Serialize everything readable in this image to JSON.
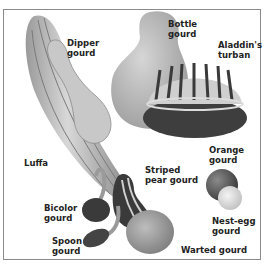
{
  "figure": {
    "labels": {
      "dipper": [
        "Dipper",
        "gourd"
      ],
      "bottle": [
        "Bottle",
        "gourd"
      ],
      "aladdin": [
        "Aladdin's",
        "turban"
      ],
      "luffa": [
        "Luffa"
      ],
      "orange": [
        "Orange",
        "gourd"
      ],
      "striped": [
        "Striped",
        "pear gourd"
      ],
      "bicolor": [
        "Bicolor",
        "gourd"
      ],
      "nestegg": [
        "Nest-egg",
        "gourd"
      ],
      "spoon": [
        "Spoon",
        "gourd"
      ],
      "warted": [
        "Warted gourd"
      ]
    }
  }
}
